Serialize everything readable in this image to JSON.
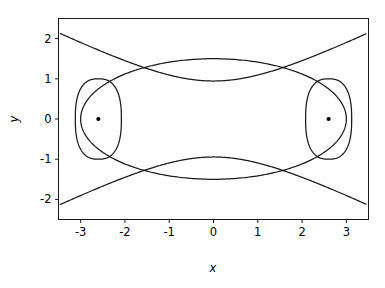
{
  "chart_data": {
    "type": "line",
    "title": "",
    "xlabel": "x",
    "ylabel": "y",
    "xlim": [
      -3.5,
      3.5
    ],
    "ylim": [
      -2.5,
      2.5
    ],
    "grid": false,
    "legend": null,
    "xticks": [
      "-3",
      "-2",
      "-1",
      "0",
      "1",
      "2",
      "3"
    ],
    "xtick_values": [
      -3,
      -2,
      -1,
      0,
      1,
      2,
      3
    ],
    "yticks": [
      "-2",
      "-1",
      "0",
      "1",
      "2"
    ],
    "ytick_values": [
      -2,
      -1,
      0,
      1,
      2
    ],
    "series": [
      {
        "name": "ellipse",
        "shape": "ellipse",
        "center": [
          0,
          0
        ],
        "semi_major_x": 3.0,
        "semi_minor_y": 1.5
      },
      {
        "name": "left-oval",
        "shape": "oval",
        "center": [
          -2.6,
          0
        ],
        "semi_x": 0.52,
        "semi_y": 1.0
      },
      {
        "name": "right-oval",
        "shape": "oval",
        "center": [
          2.6,
          0
        ],
        "semi_x": 0.52,
        "semi_y": 1.0
      },
      {
        "name": "hyperbola-upper",
        "shape": "hyperbola-branch",
        "endpoints": [
          [
            -3.5,
            2.0
          ],
          [
            3.5,
            2.0
          ]
        ],
        "vertex": [
          0,
          0
        ]
      },
      {
        "name": "hyperbola-lower",
        "shape": "hyperbola-branch",
        "endpoints": [
          [
            -3.5,
            -2.0
          ],
          [
            3.5,
            -2.0
          ]
        ],
        "vertex": [
          0,
          0
        ]
      }
    ],
    "points": [
      {
        "label": "left-focus",
        "x": -2.6,
        "y": 0
      },
      {
        "label": "right-focus",
        "x": 2.6,
        "y": 0
      }
    ]
  },
  "axes": {
    "xlabel": "x",
    "ylabel": "y"
  }
}
